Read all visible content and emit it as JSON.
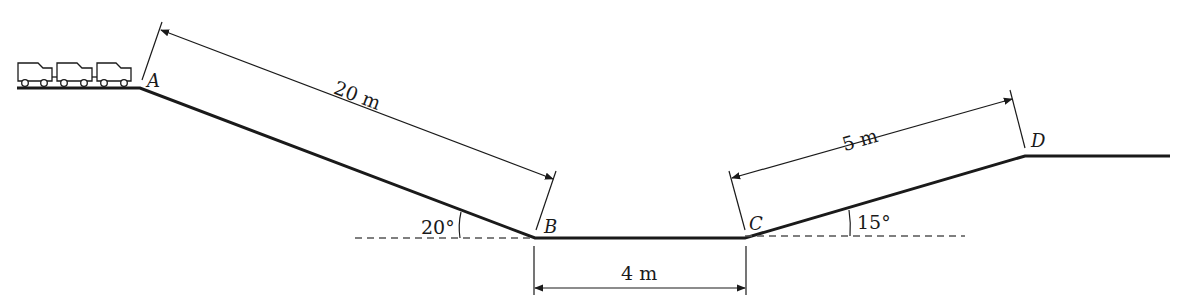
{
  "diagram": {
    "type": "track-profile",
    "points": {
      "A": "A",
      "B": "B",
      "C": "C",
      "D": "D"
    },
    "dimensions": {
      "ab_length": "20 m",
      "bc_length": "4 m",
      "cd_length": "5 m"
    },
    "angles": {
      "descent_angle": "20°",
      "ascent_angle": "15°"
    },
    "train": {
      "car_count": 3
    },
    "colors": {
      "line": "#1a1a1a",
      "dashed": "#555555"
    }
  }
}
